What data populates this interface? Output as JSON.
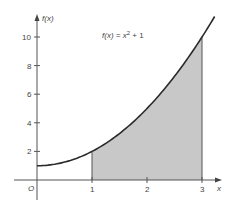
{
  "chart_data": {
    "type": "area",
    "title": "",
    "function_label": "f(x) = x² + 1",
    "function_label_parts": {
      "lhs": "f(x) = x",
      "exp": "2",
      "rhs": " + 1"
    },
    "xlabel": "x",
    "ylabel": "f(x)",
    "origin_label": "O",
    "x_ticks": [
      "1",
      "2",
      "3"
    ],
    "y_ticks": [
      "2",
      "4",
      "6",
      "8",
      "10"
    ],
    "xlim": [
      0,
      3.25
    ],
    "ylim": [
      0,
      11.5
    ],
    "grid": false,
    "legend": null,
    "series": [
      {
        "name": "f(x) = x^2 + 1",
        "x": [
          0,
          0.25,
          0.5,
          0.75,
          1,
          1.25,
          1.5,
          1.75,
          2,
          2.25,
          2.5,
          2.75,
          3,
          3.25
        ],
        "y": [
          1,
          1.0625,
          1.25,
          1.5625,
          2,
          2.5625,
          3.25,
          4.0625,
          5,
          6.0625,
          7.25,
          8.5625,
          10,
          11.5625
        ]
      }
    ],
    "shaded_region": {
      "from_x": 1,
      "to_x": 3,
      "under": "f(x) = x^2 + 1",
      "color": "#c8c8c8"
    },
    "colors": {
      "curve": "#2a2a2a",
      "axes": "#555555",
      "shade": "#c8c8c8"
    }
  }
}
